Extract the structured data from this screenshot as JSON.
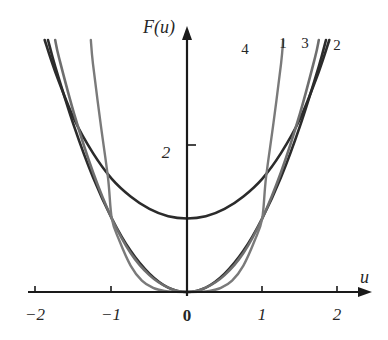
{
  "chart_data": {
    "type": "line",
    "title": "",
    "subtitle": "",
    "xlabel": "u",
    "ylabel": "F(u)",
    "xlim": [
      -2.35,
      2.45
    ],
    "ylim": [
      -0.25,
      3.85
    ],
    "xticks": [
      -2,
      -1,
      0,
      1,
      2
    ],
    "xticklabels": [
      "−2",
      "−1",
      "0",
      "1",
      "2"
    ],
    "yticks": [
      2
    ],
    "yticklabels": [
      "2"
    ],
    "grid": false,
    "legend_position": "curve-end-labels",
    "annotations": [
      "1",
      "2",
      "3",
      "4"
    ],
    "series": [
      {
        "name": "1",
        "label": "1",
        "color": "#2b2b2b",
        "width": 2.6,
        "description": "cosh-like convex curve, minimum F(0)=1",
        "x": [
          -2.0,
          -1.75,
          -1.5,
          -1.25,
          -1.0,
          -0.75,
          -0.5,
          -0.25,
          0.0,
          0.25,
          0.5,
          0.75,
          1.0,
          1.25,
          1.5,
          1.75,
          2.0
        ],
        "y": [
          3.76,
          2.99,
          2.35,
          1.89,
          1.54,
          1.3,
          1.13,
          1.03,
          1.0,
          1.03,
          1.13,
          1.3,
          1.54,
          1.89,
          2.35,
          2.99,
          3.76
        ]
      },
      {
        "name": "2",
        "label": "2",
        "color": "#2b2b2b",
        "width": 2.6,
        "description": "parabola u^2 through origin, F(1)=1, F(2)=4",
        "x": [
          -2.0,
          -1.75,
          -1.5,
          -1.25,
          -1.0,
          -0.75,
          -0.5,
          -0.25,
          0.0,
          0.25,
          0.5,
          0.75,
          1.0,
          1.25,
          1.5,
          1.75,
          2.0
        ],
        "y": [
          4.0,
          3.06,
          2.25,
          1.56,
          1.0,
          0.56,
          0.25,
          0.06,
          0.0,
          0.06,
          0.25,
          0.56,
          1.0,
          1.56,
          2.25,
          3.06,
          4.0
        ]
      },
      {
        "name": "3",
        "label": "3",
        "color": "#6e6e6e",
        "width": 2.6,
        "description": "steeper even power curve through origin, F(1)=1",
        "x": [
          -1.9,
          -1.7,
          -1.5,
          -1.25,
          -1.0,
          -0.75,
          -0.5,
          -0.25,
          0.0,
          0.25,
          0.5,
          0.75,
          1.0,
          1.25,
          1.5,
          1.7,
          1.9
        ],
        "y": [
          4.12,
          3.18,
          2.42,
          1.63,
          1.0,
          0.53,
          0.23,
          0.06,
          0.0,
          0.06,
          0.23,
          0.53,
          1.0,
          1.63,
          2.42,
          3.18,
          4.12
        ]
      },
      {
        "name": "4",
        "label": "4",
        "color": "#7a7a7a",
        "width": 2.4,
        "description": "very steep quartic-like well through origin, F(1)=1, nearly vertical at |u|>1",
        "x": [
          -1.32,
          -1.25,
          -1.15,
          -1.05,
          -1.0,
          -0.9,
          -0.75,
          -0.6,
          -0.45,
          -0.3,
          -0.15,
          0.0,
          0.15,
          0.3,
          0.45,
          0.6,
          0.75,
          0.9,
          1.0,
          1.05,
          1.15,
          1.25,
          1.32
        ],
        "y": [
          3.9,
          3.1,
          2.3,
          1.55,
          1.0,
          0.7,
          0.36,
          0.155,
          0.055,
          0.013,
          0.0015,
          0.0,
          0.0015,
          0.013,
          0.055,
          0.155,
          0.36,
          0.7,
          1.0,
          1.55,
          2.3,
          3.1,
          3.9
        ]
      }
    ],
    "curve_labels": [
      {
        "text": "4",
        "x_px": 245,
        "y_px": 54,
        "color": "#7a7a7a"
      },
      {
        "text": "1",
        "x_px": 283,
        "y_px": 48,
        "color": "#2b2b2b"
      },
      {
        "text": "3",
        "x_px": 305,
        "y_px": 48,
        "color": "#6e6e6e"
      },
      {
        "text": "2",
        "x_px": 337,
        "y_px": 50,
        "color": "#2b2b2b"
      }
    ]
  },
  "axes": {
    "y_axis_name": "F(u)",
    "x_axis_name": "u",
    "y_tick_2": "2",
    "x_tick_minus2": "−2",
    "x_tick_minus1": "−1",
    "x_tick_0": "0",
    "x_tick_1": "1",
    "x_tick_2": "2"
  },
  "colors": {
    "axis": "#1a1a1a",
    "dark_curve": "#2b2b2b",
    "gray_curve": "#6e6e6e",
    "light_gray_curve": "#7a7a7a",
    "background": "#ffffff"
  }
}
